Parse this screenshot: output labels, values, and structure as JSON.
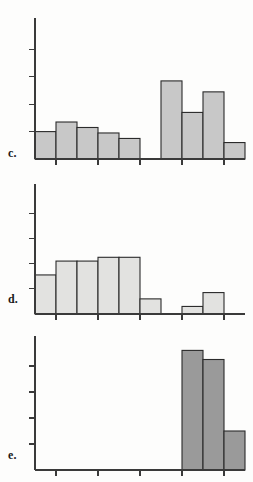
{
  "figure": {
    "title": "",
    "background_color": "#fdfdfc",
    "axis_color": "#3a3a3a",
    "bar_outline_color": "#2b2b2b"
  },
  "panels": [
    {
      "label": "c.",
      "name": "panel-c",
      "fill_color": "#c8c8c8",
      "chart_data": {
        "type": "bar",
        "title": "",
        "xlabel": "",
        "ylabel": "",
        "grid": false,
        "legend": "none",
        "xlim": [
          0,
          10
        ],
        "ylim": [
          0,
          5
        ],
        "y_ticks": [
          1,
          2,
          3,
          4
        ],
        "x_ticks": [
          1,
          3,
          5,
          7,
          9
        ],
        "bin_edges": [
          0,
          1,
          2,
          3,
          4,
          5,
          6,
          7,
          8,
          9,
          10
        ],
        "categories": [
          "0-1",
          "1-2",
          "2-3",
          "3-4",
          "4-5",
          "5-6",
          "6-7",
          "7-8",
          "8-9",
          "9-10"
        ],
        "values": [
          1.0,
          1.35,
          1.15,
          0.95,
          0.75,
          0,
          2.85,
          1.7,
          2.45,
          0.6
        ]
      }
    },
    {
      "label": "d.",
      "name": "panel-d",
      "fill_color": "#e2e2e0",
      "chart_data": {
        "type": "bar",
        "title": "",
        "xlabel": "",
        "ylabel": "",
        "grid": false,
        "legend": "none",
        "xlim": [
          0,
          10
        ],
        "ylim": [
          0,
          5
        ],
        "y_ticks": [
          1,
          2,
          3,
          4
        ],
        "x_ticks": [
          1,
          3,
          5,
          7,
          9
        ],
        "bin_edges": [
          0,
          1,
          2,
          3,
          4,
          5,
          6,
          7,
          8,
          9,
          10
        ],
        "categories": [
          "0-1",
          "1-2",
          "2-3",
          "3-4",
          "4-5",
          "5-6",
          "6-7",
          "7-8",
          "8-9",
          "9-10"
        ],
        "values": [
          1.55,
          2.1,
          2.1,
          2.25,
          2.25,
          0.6,
          0,
          0.3,
          0.85,
          0
        ]
      }
    },
    {
      "label": "e.",
      "name": "panel-e",
      "fill_color": "#9a9a9a",
      "chart_data": {
        "type": "bar",
        "title": "",
        "xlabel": "",
        "ylabel": "",
        "grid": false,
        "legend": "none",
        "xlim": [
          0,
          10
        ],
        "ylim": [
          0,
          5
        ],
        "y_ticks": [
          1,
          2,
          3,
          4
        ],
        "x_ticks": [
          1,
          3,
          5,
          7,
          9
        ],
        "bin_edges": [
          0,
          1,
          2,
          3,
          4,
          5,
          6,
          7,
          8,
          9,
          10
        ],
        "categories": [
          "0-1",
          "1-2",
          "2-3",
          "3-4",
          "4-5",
          "5-6",
          "6-7",
          "7-8",
          "8-9",
          "9-10"
        ],
        "values": [
          0,
          0,
          0,
          0,
          0,
          0,
          0,
          4.6,
          4.25,
          1.5
        ]
      }
    }
  ]
}
